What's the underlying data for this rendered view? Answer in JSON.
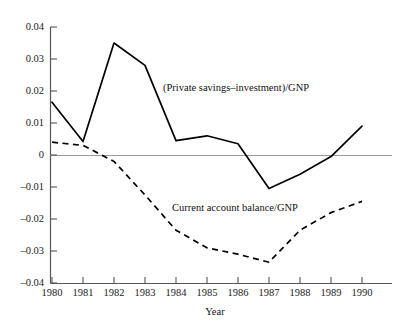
{
  "chart_data": {
    "type": "line",
    "title": "",
    "subtitle": "",
    "xlabel": "Year",
    "ylabel": "",
    "x": [
      1980,
      1981,
      1982,
      1983,
      1984,
      1985,
      1986,
      1987,
      1988,
      1989,
      1990
    ],
    "xtick_labels": [
      "1980",
      "1981",
      "1982",
      "1983",
      "1984",
      "1985",
      "1986",
      "1987",
      "1988",
      "1989",
      "1990"
    ],
    "ytick_labels": [
      "0.04",
      "0.03",
      "0.02",
      "0.01",
      "0",
      "–0.01",
      "–0.02",
      "–0.03",
      "–0.04"
    ],
    "ytick_values": [
      0.04,
      0.03,
      0.02,
      0.01,
      0,
      -0.01,
      -0.02,
      -0.03,
      -0.04
    ],
    "xlim": [
      1980,
      1990
    ],
    "ylim": [
      -0.04,
      0.04
    ],
    "grid": false,
    "legend_position": "inline-annotations",
    "zero_line": true,
    "zero_line_color": "#999999",
    "series": [
      {
        "name": "(Private savings–investment)/GNP",
        "style": "solid",
        "color": "#000000",
        "annotation_text": "(Private savings–investment)/GNP",
        "values": [
          0.0165,
          0.0042,
          0.035,
          0.028,
          0.0045,
          0.006,
          0.0035,
          -0.0105,
          -0.006,
          -0.0005,
          0.009
        ]
      },
      {
        "name": "Current account balance/GNP",
        "style": "dashed",
        "color": "#000000",
        "annotation_text": "Current account balance/GNP",
        "values": [
          0.004,
          0.003,
          -0.002,
          -0.0125,
          -0.0235,
          -0.029,
          -0.031,
          -0.0335,
          -0.0235,
          -0.018,
          -0.0145
        ]
      }
    ]
  }
}
